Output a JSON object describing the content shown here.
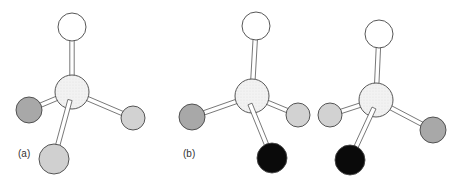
{
  "figure": {
    "panels": [
      {
        "label": "(a)",
        "label_pos": [
          18,
          155
        ],
        "center": {
          "x": 72,
          "y": 92,
          "r": 17,
          "fill": "#f0f0f0"
        },
        "atoms": [
          {
            "x": 72,
            "y": 27,
            "r": 14,
            "fill": "#ffffff",
            "role": "top-atom"
          },
          {
            "x": 29,
            "y": 110,
            "r": 13,
            "fill": "#a8a8a8",
            "role": "left-atom"
          },
          {
            "x": 133,
            "y": 118,
            "r": 12,
            "fill": "#d2d2d2",
            "role": "right-atom"
          },
          {
            "x": 54,
            "y": 159,
            "r": 15,
            "fill": "#d0d0d0",
            "role": "bottom-atom"
          }
        ]
      },
      {
        "label": "(b)",
        "label_pos": [
          183,
          155
        ],
        "center": {
          "x": 252,
          "y": 96,
          "r": 17,
          "fill": "#f0f0f0"
        },
        "atoms": [
          {
            "x": 256,
            "y": 26,
            "r": 14,
            "fill": "#ffffff",
            "role": "top-atom"
          },
          {
            "x": 192,
            "y": 117,
            "r": 13,
            "fill": "#a8a8a8",
            "role": "left-atom"
          },
          {
            "x": 298,
            "y": 115,
            "r": 12,
            "fill": "#d2d2d2",
            "role": "right-atom"
          },
          {
            "x": 272,
            "y": 158,
            "r": 15,
            "fill": "#0a0a0a",
            "role": "bottom-atom"
          }
        ]
      },
      {
        "label": "",
        "center": {
          "x": 376,
          "y": 100,
          "r": 17,
          "fill": "#f0f0f0"
        },
        "atoms": [
          {
            "x": 379,
            "y": 34,
            "r": 14,
            "fill": "#ffffff",
            "role": "top-atom"
          },
          {
            "x": 330,
            "y": 115,
            "r": 12,
            "fill": "#d2d2d2",
            "role": "left-atom"
          },
          {
            "x": 433,
            "y": 130,
            "r": 13,
            "fill": "#a8a8a8",
            "role": "right-atom"
          },
          {
            "x": 350,
            "y": 160,
            "r": 15,
            "fill": "#0a0a0a",
            "role": "bottom-atom"
          }
        ]
      }
    ]
  },
  "labels": {
    "a": "(a)",
    "b": "(b)"
  }
}
